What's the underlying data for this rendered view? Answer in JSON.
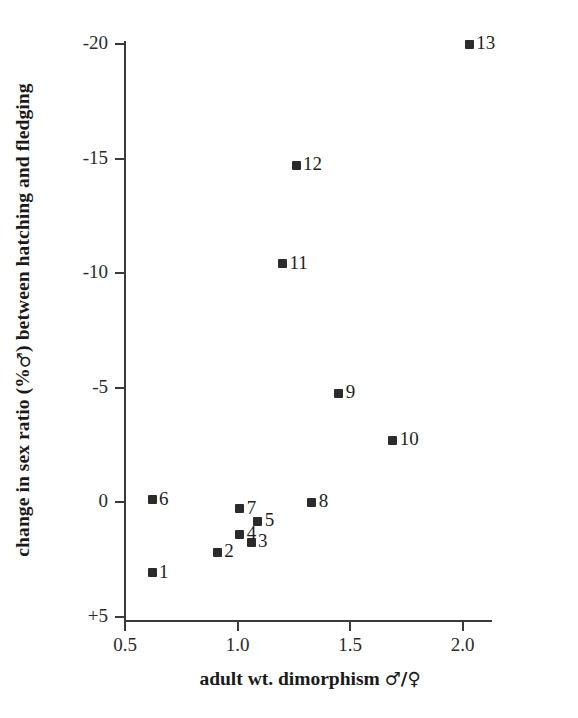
{
  "chart_data": {
    "type": "scatter",
    "title": "",
    "xlabel": "adult wt. dimorphism ♂/♀",
    "ylabel": "change in sex ratio (% ♂) between hatching and fledging",
    "xlabel_text": "adult wt. dimorphism",
    "xlabel_symbol": "♂/♀",
    "ylabel_part1": "change in sex ratio (%",
    "ylabel_symbol": "♂",
    "ylabel_part2": ") between hatching and fledging",
    "xlim": [
      0.4,
      2.2
    ],
    "ylim": [
      5,
      -20
    ],
    "y_axis_inverted": true,
    "grid": false,
    "legend": false,
    "xticks": [
      0.5,
      1.0,
      1.5,
      2.0
    ],
    "xticklabels": [
      "0.5",
      "1.0",
      "1.5",
      "2.0"
    ],
    "yticks": [
      -20,
      -15,
      -10,
      -5,
      0,
      5
    ],
    "yticklabels": [
      "-20",
      "-15",
      "-10",
      "-5",
      "0",
      "+5"
    ],
    "marker": "square",
    "marker_color": "#2b2b2b",
    "points": [
      {
        "label": "1",
        "x": 0.62,
        "y": 3.1,
        "label_pos": "right"
      },
      {
        "label": "2",
        "x": 0.91,
        "y": 2.2,
        "label_pos": "right"
      },
      {
        "label": "3",
        "x": 1.06,
        "y": 1.75,
        "label_pos": "right"
      },
      {
        "label": "4",
        "x": 1.01,
        "y": 1.4,
        "label_pos": "right"
      },
      {
        "label": "5",
        "x": 1.09,
        "y": 0.85,
        "label_pos": "right"
      },
      {
        "label": "6",
        "x": 0.62,
        "y": -0.1,
        "label_pos": "right"
      },
      {
        "label": "7",
        "x": 1.01,
        "y": 0.3,
        "label_pos": "right"
      },
      {
        "label": "8",
        "x": 1.33,
        "y": 0.0,
        "label_pos": "right"
      },
      {
        "label": "9",
        "x": 1.45,
        "y": -4.75,
        "label_pos": "right"
      },
      {
        "label": "10",
        "x": 1.69,
        "y": -2.7,
        "label_pos": "right"
      },
      {
        "label": "11",
        "x": 1.2,
        "y": -10.4,
        "label_pos": "right"
      },
      {
        "label": "12",
        "x": 1.26,
        "y": -14.7,
        "label_pos": "right"
      },
      {
        "label": "13",
        "x": 2.03,
        "y": -20.0,
        "label_pos": "right"
      }
    ]
  }
}
